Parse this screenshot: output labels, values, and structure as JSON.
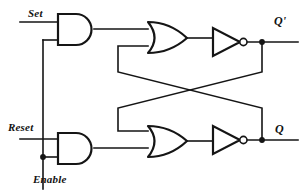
{
  "diagram": {
    "background_color": "#ffffff",
    "line_color": "#151515",
    "line_width": 1.6,
    "width": 301,
    "height": 194
  },
  "labels": {
    "set": "Set",
    "reset": "Reset",
    "enable": "Enable",
    "q_prime": "Q'",
    "q": "Q"
  },
  "inputs": [
    {
      "name": "set",
      "label": "Set",
      "x": 20,
      "y": 22
    },
    {
      "name": "reset",
      "label": "Reset",
      "x": 20,
      "y": 139
    },
    {
      "name": "enable",
      "label": "Enable",
      "x": 43,
      "y": 189
    }
  ],
  "outputs": [
    {
      "name": "q-prime",
      "label": "Q'",
      "x": 298,
      "y": 42
    },
    {
      "name": "q",
      "label": "Q",
      "x": 298,
      "y": 140
    }
  ],
  "gates": [
    {
      "name": "and-gate-set",
      "type": "AND",
      "x": 58,
      "y": 14,
      "w": 36,
      "h": 31
    },
    {
      "name": "or-gate-top",
      "type": "OR",
      "x": 148,
      "y": 22,
      "w": 39,
      "h": 31
    },
    {
      "name": "inverter-top",
      "type": "INVERTER",
      "x": 213,
      "y": 28,
      "w": 30,
      "h": 28
    },
    {
      "name": "and-gate-reset",
      "type": "AND",
      "x": 58,
      "y": 133,
      "w": 36,
      "h": 31
    },
    {
      "name": "or-gate-bottom",
      "type": "OR",
      "x": 148,
      "y": 126,
      "w": 39,
      "h": 31
    },
    {
      "name": "inverter-bottom",
      "type": "INVERTER",
      "x": 213,
      "y": 126,
      "w": 30,
      "h": 28
    }
  ],
  "junctions": [
    {
      "name": "junction-enable-tap",
      "x": 43,
      "y": 157
    },
    {
      "name": "junction-q-prime",
      "x": 262,
      "y": 42
    },
    {
      "name": "junction-q",
      "x": 262,
      "y": 140
    }
  ],
  "nets": [
    {
      "name": "net-set-input",
      "path": "M 20 22 L 58 22"
    },
    {
      "name": "net-enable-to-and-top",
      "path": "M 43 189 L 43 40 L 58 40"
    },
    {
      "name": "net-reset-input",
      "path": "M 20 139 L 58 139"
    },
    {
      "name": "net-enable-to-and-bot",
      "path": "M 43 157 L 58 157"
    },
    {
      "name": "net-and-top-to-or-top",
      "path": "M 94 29 L 148 29"
    },
    {
      "name": "net-and-bot-to-or-bot",
      "path": "M 94 148 L 148 148"
    },
    {
      "name": "net-or-top-to-inv-top",
      "path": "M 187 38 L 213 38"
    },
    {
      "name": "net-or-bot-to-inv-bot",
      "path": "M 187 141 L 213 141"
    },
    {
      "name": "net-inv-top-out",
      "path": "M 247 42 L 298 42"
    },
    {
      "name": "net-inv-bot-out",
      "path": "M 247 140 L 298 140"
    },
    {
      "name": "net-feedback-q-to-or-top",
      "path": "M 262 42 L 262 72 L 118 108 L 118 46 L 148 46"
    },
    {
      "name": "net-feedback-qp-to-or-bot",
      "path": "M 262 140 L 262 108 L 118 72 L 118 131 L 148 131"
    }
  ]
}
